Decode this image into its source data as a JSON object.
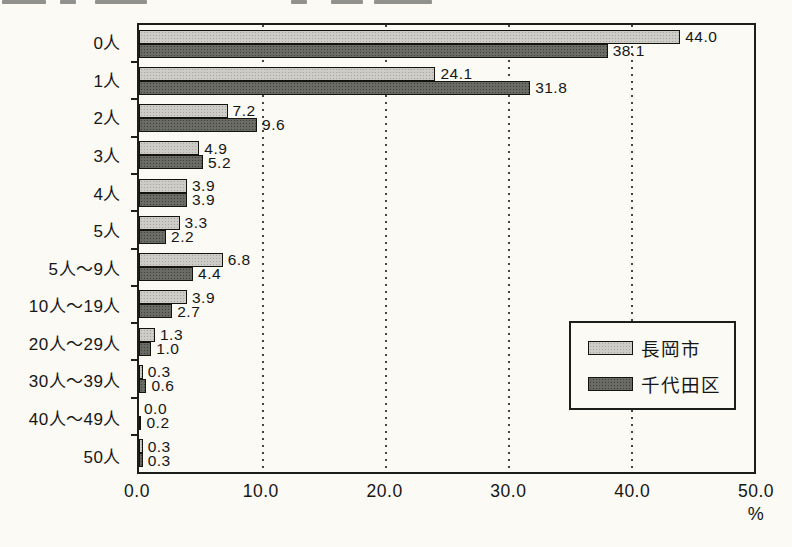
{
  "chart_data": {
    "type": "bar",
    "orientation": "horizontal",
    "categories": [
      "0人",
      "1人",
      "2人",
      "3人",
      "4人",
      "5人",
      "5人〜9人",
      "10人〜19人",
      "20人〜29人",
      "30人〜39人",
      "40人〜49人",
      "50人"
    ],
    "series": [
      {
        "name": "長岡市",
        "color": "#cdccc6",
        "values": [
          44.0,
          24.1,
          7.2,
          4.9,
          3.9,
          3.3,
          6.8,
          3.9,
          1.3,
          0.3,
          0.0,
          0.3
        ]
      },
      {
        "name": "千代田区",
        "color": "#6b6b66",
        "values": [
          38.1,
          31.8,
          9.6,
          5.2,
          3.9,
          2.2,
          4.4,
          2.7,
          1.0,
          0.6,
          0.2,
          0.3
        ]
      }
    ],
    "x_ticks": [
      "0.0",
      "10.0",
      "20.0",
      "30.0",
      "40.0",
      "50.0"
    ],
    "x_gridlines": [
      10,
      20,
      30,
      40
    ],
    "xlim": [
      0,
      50
    ],
    "xlabel_unit": "%",
    "value_labels": true,
    "grid": "vertical-dotted",
    "legend_position": "middle-right",
    "title": "",
    "colors": {
      "axis": "#1d1d1a",
      "paper": "#fbfaf5"
    }
  }
}
